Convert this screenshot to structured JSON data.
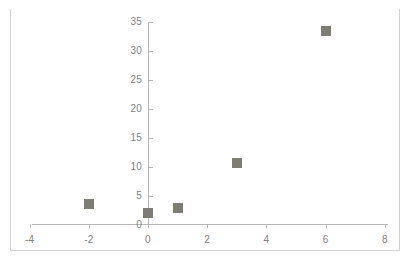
{
  "chart_data": {
    "type": "scatter",
    "title": "",
    "subtitle": "",
    "xlabel": "",
    "ylabel": "",
    "legend": [],
    "legend_position": "none",
    "grid": false,
    "xlim": [
      -4,
      8
    ],
    "ylim": [
      0,
      35
    ],
    "x_ticks": [
      -4,
      -2,
      0,
      2,
      4,
      6,
      8
    ],
    "y_ticks": [
      0,
      5,
      10,
      15,
      20,
      25,
      30,
      35
    ],
    "x_tick_labels": [
      "-4",
      "-2",
      "0",
      "2",
      "4",
      "6",
      "8"
    ],
    "y_tick_labels": [
      "0",
      "5",
      "10",
      "15",
      "20",
      "25",
      "30",
      "35"
    ],
    "series": [
      {
        "name": "",
        "marker": "square",
        "color": "#7d7d75",
        "points": [
          {
            "x": -2,
            "y": 3.5
          },
          {
            "x": 0,
            "y": 2.0
          },
          {
            "x": 1,
            "y": 2.8
          },
          {
            "x": 3,
            "y": 10.6
          },
          {
            "x": 6,
            "y": 33.4
          }
        ]
      }
    ]
  },
  "axis": {
    "x_axis_name": "x-axis",
    "y_axis_name": "y-axis"
  },
  "colors": {
    "marker": "#7d7d75",
    "axis_line": "#b6b6b6",
    "tick_label": "#808080",
    "frame": "#d2d2d2",
    "background": "#ffffff"
  }
}
